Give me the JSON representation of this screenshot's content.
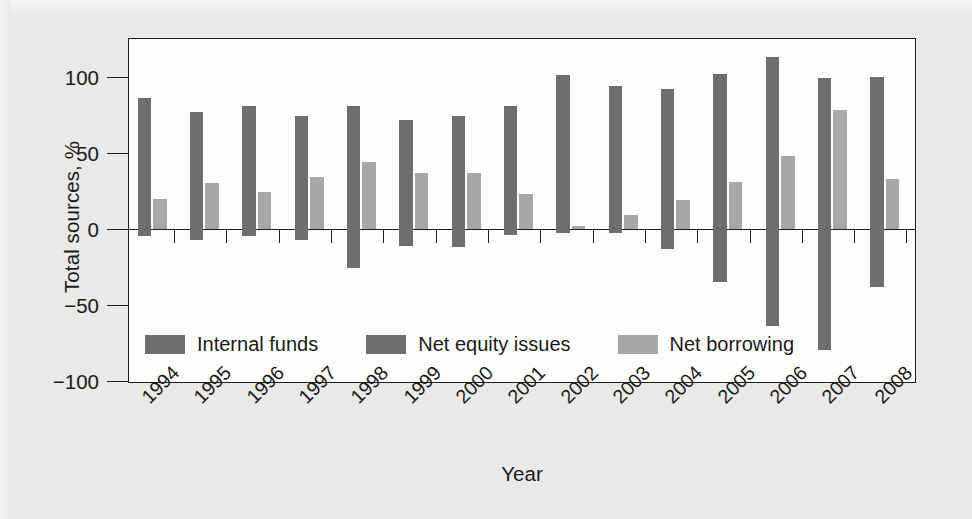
{
  "figure": {
    "ylabel": "Total sources, %",
    "xlabel": "Year"
  },
  "legend": {
    "items": [
      {
        "label": "Internal funds",
        "color": "#6e6e6e",
        "swatch_name": "internal-funds"
      },
      {
        "label": "Net equity issues",
        "color": "#6e6e6e",
        "swatch_name": "net-equity-issues"
      },
      {
        "label": "Net borrowing",
        "color": "#a6a6a6",
        "swatch_name": "net-borrowing"
      }
    ]
  },
  "axes": {
    "y_ticks": [
      100,
      50,
      0,
      -50,
      -100
    ],
    "y_tick_labels": [
      "100",
      "50",
      "0",
      "−50",
      "−100"
    ],
    "ylim": [
      -100,
      125
    ],
    "x_tick_labels": [
      "1994",
      "1995",
      "1996",
      "1997",
      "1998",
      "1999",
      "2000",
      "2001",
      "2002",
      "2003",
      "2004",
      "2005",
      "2006",
      "2007",
      "2008"
    ]
  },
  "chart_data": {
    "type": "bar",
    "title": "",
    "xlabel": "Year",
    "ylabel": "Total sources, %",
    "ylim": [
      -100,
      125
    ],
    "grid": false,
    "legend_position": "inside-lower-left",
    "categories": [
      "1994",
      "1995",
      "1996",
      "1997",
      "1998",
      "1999",
      "2000",
      "2001",
      "2002",
      "2003",
      "2004",
      "2005",
      "2006",
      "2007",
      "2008"
    ],
    "series": [
      {
        "name": "Internal funds",
        "color": "#6e6e6e",
        "values": [
          86,
          77,
          81,
          74,
          81,
          72,
          74,
          81,
          101,
          94,
          92,
          102,
          113,
          99,
          100
        ]
      },
      {
        "name": "Net equity issues",
        "color": "#6e6e6e",
        "values": [
          -5,
          -7,
          -5,
          -7,
          -26,
          -11,
          -12,
          -4,
          -3,
          -3,
          -13,
          -35,
          -64,
          -80,
          -38
        ]
      },
      {
        "name": "Net borrowing",
        "color": "#a6a6a6",
        "values": [
          20,
          30,
          24,
          34,
          44,
          37,
          37,
          23,
          2,
          9,
          19,
          31,
          48,
          78,
          33
        ]
      }
    ]
  },
  "colors": {
    "background": "#e9e9e7",
    "plot_background": "#fdfdfc",
    "axis": "#1d1d1d",
    "dark_bar": "#6e6e6e",
    "light_bar": "#a6a6a6"
  }
}
